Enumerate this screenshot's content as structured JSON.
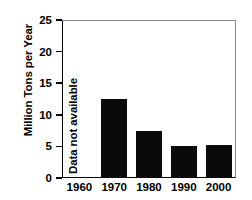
{
  "chart_data": {
    "type": "bar",
    "title": "",
    "xlabel": "",
    "ylabel": "Million Tons per Year",
    "categories": [
      "1960",
      "1970",
      "1980",
      "1990",
      "2000"
    ],
    "values": [
      null,
      12.5,
      7.4,
      5.0,
      5.2
    ],
    "ylim": [
      0,
      25
    ],
    "yticks": [
      "0",
      "5",
      "10",
      "15",
      "20",
      "25"
    ],
    "ytick_values": [
      0,
      5,
      10,
      15,
      20,
      25
    ],
    "grid": false,
    "legend": null,
    "annotations": [
      {
        "text": "Data not available",
        "category": "1960",
        "orientation": "vertical"
      }
    ],
    "colors": {
      "bar": "#0a0a0a",
      "background": "#ffffff",
      "axis": "#000000",
      "frame": "#8a8a8a"
    }
  }
}
